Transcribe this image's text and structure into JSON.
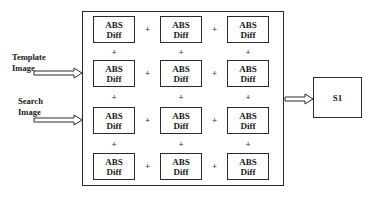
{
  "diagram": {
    "inputs": [
      {
        "label_line1": "Template",
        "label_line2": "Image"
      },
      {
        "label_line1": "Search",
        "label_line2": "Image"
      }
    ],
    "cell": {
      "line1": "ABS",
      "line2": "Diff"
    },
    "grid": {
      "rows": 4,
      "cols": 3
    },
    "operator": "+",
    "output": {
      "label": "S1"
    }
  }
}
